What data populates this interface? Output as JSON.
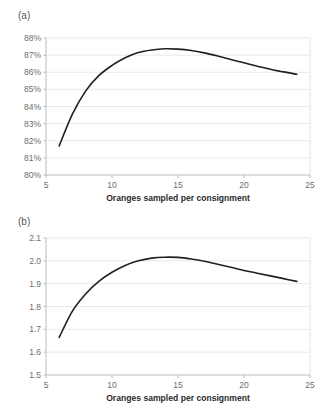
{
  "figure": {
    "panel_a_label": "(a)",
    "panel_b_label": "(b)",
    "shared_xlabel": "Oranges sampled per consignment",
    "curve_color": "#231f20",
    "gridline_color": "#e3e3e3",
    "axis_color": "#b4b4b4",
    "tick_label_color": "#6e6e6e",
    "background_color": "#ffffff",
    "bottom_caption_fragment": ""
  },
  "chart_data": [
    {
      "type": "line",
      "title": "(a)",
      "xlabel": "Oranges sampled per consignment",
      "ylabel": "",
      "xlim": [
        5,
        25
      ],
      "ylim": [
        80,
        88
      ],
      "xticks": [
        5,
        10,
        15,
        20,
        25
      ],
      "xtick_labels": [
        "5",
        "10",
        "15",
        "20",
        "25"
      ],
      "yticks": [
        80,
        81,
        82,
        83,
        84,
        85,
        86,
        87,
        88
      ],
      "ytick_labels": [
        "80%",
        "81%",
        "82%",
        "83%",
        "84%",
        "85%",
        "86%",
        "87%",
        "88%"
      ],
      "grid": "horizontal",
      "legend": "none",
      "series": [
        {
          "name": "detection rate",
          "x": [
            6,
            7,
            8,
            9,
            10,
            11,
            12,
            13,
            14,
            15,
            16,
            17,
            18,
            19,
            20,
            21,
            22,
            23,
            24
          ],
          "values": [
            81.7,
            83.55,
            84.9,
            85.8,
            86.4,
            86.85,
            87.15,
            87.3,
            87.37,
            87.35,
            87.27,
            87.13,
            86.95,
            86.75,
            86.55,
            86.35,
            86.18,
            86.02,
            85.88
          ]
        }
      ],
      "peak": {
        "x": 14.3,
        "y": 87.37
      }
    },
    {
      "type": "line",
      "title": "(b)",
      "xlabel": "Oranges sampled per consignment",
      "ylabel": "",
      "xlim": [
        5,
        25
      ],
      "ylim": [
        1.5,
        2.1
      ],
      "xticks": [
        5,
        10,
        15,
        20,
        25
      ],
      "xtick_labels": [
        "5",
        "10",
        "15",
        "20",
        "25"
      ],
      "yticks": [
        1.5,
        1.6,
        1.7,
        1.8,
        1.9,
        2.0,
        2.1
      ],
      "ytick_labels": [
        "1.5",
        "1.6",
        "1.7",
        "1.8",
        "1.9",
        "2.0",
        "2.1"
      ],
      "grid": "horizontal",
      "legend": "none",
      "series": [
        {
          "name": "expected value",
          "x": [
            6,
            7,
            8,
            9,
            10,
            11,
            12,
            13,
            14,
            15,
            16,
            17,
            18,
            19,
            20,
            21,
            22,
            23,
            24
          ],
          "values": [
            1.665,
            1.78,
            1.855,
            1.91,
            1.95,
            1.98,
            2.0,
            2.012,
            2.016,
            2.015,
            2.008,
            1.998,
            1.985,
            1.972,
            1.958,
            1.946,
            1.934,
            1.922,
            1.91
          ]
        }
      ],
      "peak": {
        "x": 14.3,
        "y": 2.016
      }
    }
  ]
}
